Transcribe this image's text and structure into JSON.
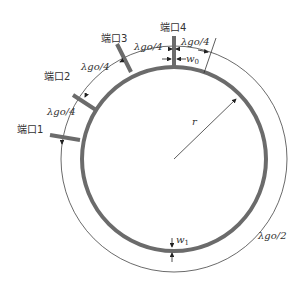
{
  "diagram": {
    "type": "ring-coupler-schematic",
    "ports": [
      {
        "id": "port1",
        "label": "端口1"
      },
      {
        "id": "port2",
        "label": "端口2"
      },
      {
        "id": "port3",
        "label": "端口3"
      },
      {
        "id": "port4",
        "label": "端口4"
      }
    ],
    "dimensions": {
      "quarter_wave_1": "λgo/4",
      "quarter_wave_2": "λgo/4",
      "quarter_wave_3": "λgo/4",
      "quarter_wave_4": "λgo/4",
      "half_wave": "λgo/2",
      "radius": "r",
      "port_width": "w0",
      "ring_width": "w1"
    },
    "colors": {
      "ring": "#6b6b6b",
      "line": "#333333",
      "background": "#ffffff"
    }
  }
}
